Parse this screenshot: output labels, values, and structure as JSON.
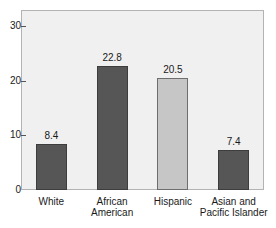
{
  "top_strip_text": "",
  "chart_data": {
    "type": "bar",
    "title": "",
    "subtitle": "",
    "xlabel": "",
    "ylabel": "",
    "ylim": [
      0,
      33
    ],
    "grid": false,
    "legend": "none",
    "yticks": [
      {
        "value": 0,
        "label": "0"
      },
      {
        "value": 10,
        "label": "10"
      },
      {
        "value": 20,
        "label": "20"
      },
      {
        "value": 30,
        "label": "30"
      }
    ],
    "categories": [
      "White",
      "African American",
      "Hispanic",
      "Asian and Pacific Islander"
    ],
    "category_lines": [
      [
        "White",
        ""
      ],
      [
        "African",
        "American"
      ],
      [
        "Hispanic",
        ""
      ],
      [
        "Asian and",
        "Pacific Islander"
      ]
    ],
    "values": [
      8.4,
      22.8,
      20.5,
      7.4
    ],
    "value_labels": [
      "8.4",
      "22.8",
      "20.5",
      "7.4"
    ],
    "bar_colors": [
      "#565656",
      "#565656",
      "#c6c6c6",
      "#565656"
    ],
    "colors": {
      "bar_dark": "#565656",
      "bar_light": "#c6c6c6",
      "plot_background": "#f0f0f0",
      "frame": "#b3b3b3",
      "text": "#1a1a1a",
      "page_background": "#ffffff"
    }
  }
}
